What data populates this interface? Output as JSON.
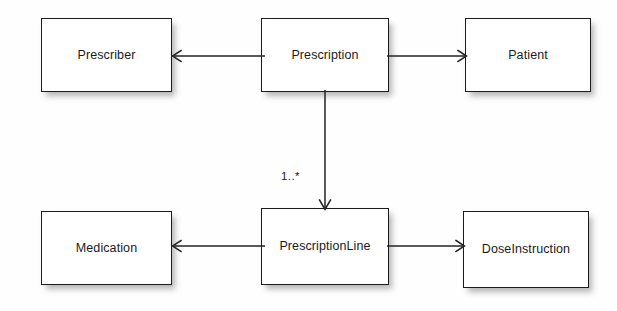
{
  "diagram": {
    "type": "uml-class-diagram",
    "background_color": "#fefefe",
    "line_color": "#232323",
    "box_fill_color": "#ffffff",
    "box_border_color": "#1c1c1c",
    "nodes": [
      {
        "id": "prescriber",
        "label": "Prescriber"
      },
      {
        "id": "prescription",
        "label": "Prescription"
      },
      {
        "id": "patient",
        "label": "Patient"
      },
      {
        "id": "medication",
        "label": "Medication"
      },
      {
        "id": "prescline",
        "label": "PrescriptionLine"
      },
      {
        "id": "doseinstr",
        "label": "DoseInstruction"
      }
    ],
    "edges": [
      {
        "id": "prescription-prescriber",
        "from": "prescription",
        "to": "prescriber",
        "direction": "left",
        "arrowhead": "open",
        "multiplicity": ""
      },
      {
        "id": "prescription-patient",
        "from": "prescription",
        "to": "patient",
        "direction": "right",
        "arrowhead": "open",
        "multiplicity": ""
      },
      {
        "id": "prescription-prescline",
        "from": "prescription",
        "to": "prescline",
        "direction": "down",
        "arrowhead": "open",
        "multiplicity": "1..*"
      },
      {
        "id": "prescline-medication",
        "from": "prescline",
        "to": "medication",
        "direction": "left",
        "arrowhead": "open",
        "multiplicity": ""
      },
      {
        "id": "prescline-doseinstr",
        "from": "prescline",
        "to": "doseinstr",
        "direction": "right",
        "arrowhead": "open",
        "multiplicity": ""
      }
    ],
    "labels": {
      "multiplicity_prescription_prescline": "1..*"
    }
  }
}
